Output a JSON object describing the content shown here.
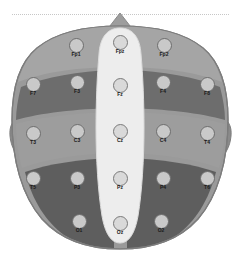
{
  "figure": {
    "orientation": "nose at top, left hemisphere on left"
  },
  "colors": {
    "background": "#ffffff",
    "scalp_outline": "#8c8c8c",
    "frontal_band": "#9e9e9e",
    "frontal_lobe": "#6f6f6f",
    "temporal_central": "#9a9a9a",
    "parietal_occipital": "#5f5f5f",
    "midline_strip": "#ededed",
    "ear": "#8a8a8a",
    "electrode_fill": "#c3c3c3",
    "electrode_midline_fill": "#d9d9d9",
    "electrode_stroke": "#6d6d6d",
    "label_text": "#1a1a1a",
    "top_rule": "#bdbdbd"
  },
  "regions": [
    {
      "name": "nose-marker",
      "label": ""
    },
    {
      "name": "frontal-band",
      "label": ""
    },
    {
      "name": "frontal-lobe-left",
      "label": ""
    },
    {
      "name": "frontal-lobe-right",
      "label": ""
    },
    {
      "name": "temporal-central-left",
      "label": ""
    },
    {
      "name": "temporal-central-right",
      "label": ""
    },
    {
      "name": "parietal-occipital-left",
      "label": ""
    },
    {
      "name": "parietal-occipital-right",
      "label": ""
    },
    {
      "name": "midline-strip",
      "label": ""
    },
    {
      "name": "ear-left",
      "label": ""
    },
    {
      "name": "ear-right",
      "label": ""
    }
  ],
  "electrodes": [
    {
      "id": "Fp1",
      "label": "Fp1",
      "x": 76,
      "y": 45,
      "row": 1,
      "group": "left",
      "style": "lateral"
    },
    {
      "id": "Fpz",
      "label": "Fpz",
      "x": 120,
      "y": 42,
      "row": 1,
      "group": "midline",
      "style": "midline"
    },
    {
      "id": "Fp2",
      "label": "Fp2",
      "x": 164,
      "y": 45,
      "row": 1,
      "group": "right",
      "style": "lateral"
    },
    {
      "id": "F7",
      "label": "F7",
      "x": 33,
      "y": 84,
      "row": 2,
      "group": "left",
      "style": "lateral"
    },
    {
      "id": "F3",
      "label": "F3",
      "x": 77,
      "y": 82,
      "row": 2,
      "group": "left",
      "style": "lateral"
    },
    {
      "id": "Fz",
      "label": "Fz",
      "x": 120,
      "y": 85,
      "row": 2,
      "group": "midline",
      "style": "midline"
    },
    {
      "id": "F4",
      "label": "F4",
      "x": 163,
      "y": 82,
      "row": 2,
      "group": "right",
      "style": "lateral"
    },
    {
      "id": "F8",
      "label": "F8",
      "x": 207,
      "y": 84,
      "row": 2,
      "group": "right",
      "style": "lateral"
    },
    {
      "id": "T3",
      "label": "T3",
      "x": 33,
      "y": 133,
      "row": 3,
      "group": "left",
      "style": "lateral"
    },
    {
      "id": "C3",
      "label": "C3",
      "x": 77,
      "y": 131,
      "row": 3,
      "group": "left",
      "style": "lateral"
    },
    {
      "id": "Cz",
      "label": "Cz",
      "x": 120,
      "y": 131,
      "row": 3,
      "group": "midline",
      "style": "midline"
    },
    {
      "id": "C4",
      "label": "C4",
      "x": 163,
      "y": 131,
      "row": 3,
      "group": "right",
      "style": "lateral"
    },
    {
      "id": "T4",
      "label": "T4",
      "x": 207,
      "y": 133,
      "row": 3,
      "group": "right",
      "style": "lateral"
    },
    {
      "id": "T5",
      "label": "T5",
      "x": 33,
      "y": 178,
      "row": 4,
      "group": "left",
      "style": "lateral"
    },
    {
      "id": "P3",
      "label": "P3",
      "x": 77,
      "y": 178,
      "row": 4,
      "group": "left",
      "style": "lateral"
    },
    {
      "id": "Pz",
      "label": "Pz",
      "x": 120,
      "y": 178,
      "row": 4,
      "group": "midline",
      "style": "midline"
    },
    {
      "id": "P4",
      "label": "P4",
      "x": 163,
      "y": 178,
      "row": 4,
      "group": "right",
      "style": "lateral"
    },
    {
      "id": "T6",
      "label": "T6",
      "x": 207,
      "y": 178,
      "row": 4,
      "group": "right",
      "style": "lateral"
    },
    {
      "id": "O1",
      "label": "O1",
      "x": 79,
      "y": 221,
      "row": 5,
      "group": "left",
      "style": "lateral"
    },
    {
      "id": "Oz",
      "label": "Oz",
      "x": 120,
      "y": 223,
      "row": 5,
      "group": "midline",
      "style": "midline"
    },
    {
      "id": "O2",
      "label": "O2",
      "x": 161,
      "y": 221,
      "row": 5,
      "group": "right",
      "style": "lateral"
    }
  ]
}
